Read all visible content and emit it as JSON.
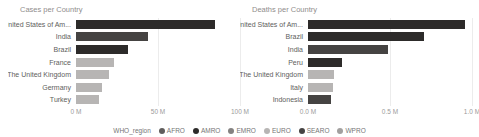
{
  "chart_data": [
    {
      "type": "bar",
      "orientation": "horizontal",
      "title": "Cases per Country",
      "categories": [
        "United States of Am...",
        "India",
        "Brazil",
        "France",
        "The United Kingdom",
        "Germany",
        "Turkey"
      ],
      "values": [
        85,
        44,
        32,
        23,
        20,
        16,
        14
      ],
      "regions": [
        "AMRO",
        "SEARO",
        "AMRO",
        "EURO",
        "EURO",
        "EURO",
        "EURO"
      ],
      "unit": "M",
      "xlabel": "",
      "ylabel": "",
      "xlim": [
        0,
        100
      ],
      "x_ticks": [
        {
          "label": "0 M",
          "pos": 0
        },
        {
          "label": "50 M",
          "pos": 50
        },
        {
          "label": "100 M",
          "pos": 100
        }
      ],
      "grid": true,
      "sorted": "descending"
    },
    {
      "type": "bar",
      "orientation": "horizontal",
      "title": "Deaths per Country",
      "categories": [
        "United States of Am...",
        "Brazil",
        "India",
        "Peru",
        "The United Kingdom",
        "Italy",
        "Indonesia"
      ],
      "values": [
        0.96,
        0.71,
        0.49,
        0.21,
        0.16,
        0.15,
        0.14
      ],
      "regions": [
        "AMRO",
        "AMRO",
        "SEARO",
        "AMRO",
        "EURO",
        "EURO",
        "SEARO"
      ],
      "unit": "M",
      "xlabel": "",
      "ylabel": "",
      "xlim": [
        0,
        1.0
      ],
      "x_ticks": [
        {
          "label": "0.0 M",
          "pos": 0
        },
        {
          "label": "0.5 M",
          "pos": 0.5
        },
        {
          "label": "1.0 M",
          "pos": 1.0
        }
      ],
      "grid": true,
      "sorted": "descending"
    }
  ],
  "legend": {
    "title": "WHO_region",
    "position": "bottom-center",
    "items": [
      {
        "label": "AFRO",
        "color": "#5f5d5c"
      },
      {
        "label": "AMRO",
        "color": "#2d2b2a"
      },
      {
        "label": "EMRO",
        "color": "#848281"
      },
      {
        "label": "EURO",
        "color": "#b7b5b4"
      },
      {
        "label": "SEARO",
        "color": "#454342"
      },
      {
        "label": "WPRO",
        "color": "#a2a09f"
      }
    ]
  },
  "region_colors": {
    "AFRO": "#5f5d5c",
    "AMRO": "#2d2b2a",
    "EMRO": "#848281",
    "EURO": "#b7b5b4",
    "SEARO": "#454342",
    "WPRO": "#a2a09f"
  },
  "colors": {
    "background": "#ffffff",
    "title_text": "#8f8d8c",
    "axis_text": "#9b9b9b",
    "label_text": "#605e5c",
    "gridline": "#ececec"
  }
}
